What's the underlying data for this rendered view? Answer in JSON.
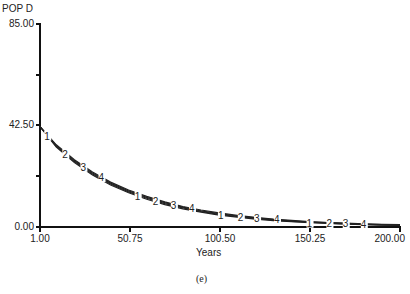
{
  "chart_data": {
    "type": "line",
    "title": "",
    "ylabel": "POP D",
    "xlabel": "Years",
    "caption": "(e)",
    "xlim": [
      1.0,
      200.0
    ],
    "ylim": [
      0.0,
      85.0
    ],
    "x_ticks": [
      "1.00",
      "50.75",
      "100.50",
      "150.25",
      "200.00"
    ],
    "y_ticks": [
      "0.00",
      "42.50",
      "85.00"
    ],
    "grid": false,
    "legend": "inline numeric markers 1-4 along curves",
    "x": [
      1,
      10,
      20,
      30,
      40,
      50,
      60,
      70,
      80,
      90,
      100,
      110,
      120,
      130,
      140,
      150,
      160,
      170,
      180,
      190,
      200
    ],
    "series": [
      {
        "name": "1",
        "values": [
          42.0,
          33.5,
          27.0,
          21.8,
          17.6,
          14.3,
          11.6,
          9.4,
          7.6,
          6.2,
          5.0,
          4.1,
          3.3,
          2.7,
          2.2,
          1.8,
          1.5,
          1.2,
          1.0,
          0.8,
          0.7
        ]
      },
      {
        "name": "2",
        "values": [
          42.0,
          33.8,
          27.4,
          22.2,
          18.0,
          14.7,
          12.0,
          9.8,
          8.0,
          6.5,
          5.3,
          4.4,
          3.6,
          2.9,
          2.4,
          2.0,
          1.6,
          1.3,
          1.1,
          0.9,
          0.8
        ]
      },
      {
        "name": "3",
        "values": [
          42.0,
          34.1,
          27.8,
          22.6,
          18.4,
          15.1,
          12.4,
          10.2,
          8.3,
          6.8,
          5.6,
          4.6,
          3.8,
          3.1,
          2.6,
          2.1,
          1.8,
          1.5,
          1.2,
          1.0,
          0.9
        ]
      },
      {
        "name": "4",
        "values": [
          42.0,
          34.4,
          28.2,
          23.0,
          18.8,
          15.5,
          12.8,
          10.5,
          8.6,
          7.1,
          5.9,
          4.9,
          4.0,
          3.3,
          2.8,
          2.3,
          1.9,
          1.6,
          1.3,
          1.1,
          1.0
        ]
      }
    ],
    "markers": [
      "1",
      "2",
      "3",
      "4",
      "1",
      "2",
      "3",
      "4",
      "1",
      "2",
      "3",
      "4",
      "1",
      "2",
      "3",
      "4"
    ]
  }
}
